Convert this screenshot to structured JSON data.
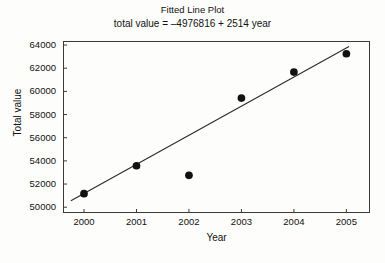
{
  "chart_data": {
    "type": "scatter",
    "title": "Fitted Line Plot",
    "subtitle": "total value = –4976816 + 2514 year",
    "xlabel": "Year",
    "ylabel": "Total value",
    "xlim": [
      1999.6,
      2005.45
    ],
    "ylim": [
      49500,
      64350
    ],
    "grid": false,
    "legend": false,
    "x": [
      2000,
      2001,
      2002,
      2003,
      2004,
      2005
    ],
    "values": [
      51170,
      53580,
      52750,
      59420,
      61670,
      63250
    ],
    "xticks": [
      2000,
      2001,
      2002,
      2003,
      2004,
      2005
    ],
    "xtick_labels": [
      "2000",
      "2001",
      "2002",
      "2003",
      "2004",
      "2005"
    ],
    "yticks": [
      50000,
      52000,
      54000,
      56000,
      58000,
      60000,
      62000,
      64000
    ],
    "ytick_labels": [
      "50000",
      "52000",
      "54000",
      "56000",
      "58000",
      "60000",
      "62000",
      "64000"
    ],
    "fit_line": {
      "intercept": -4976816,
      "slope": 2514,
      "x_start": 1999.75,
      "x_end": 2005.05,
      "color": "#2b2b2b"
    },
    "marker": {
      "shape": "circle",
      "color": "#121212",
      "size": 5.2
    }
  }
}
